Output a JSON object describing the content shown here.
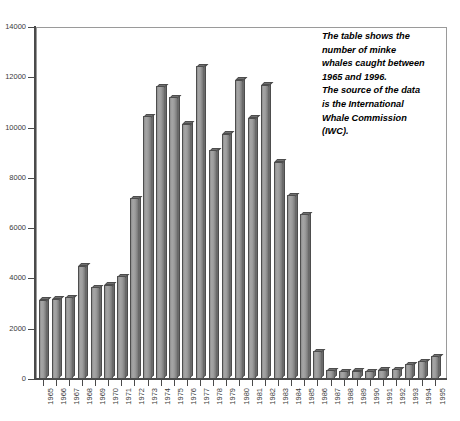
{
  "chart_data": {
    "type": "bar",
    "title": "",
    "xlabel": "",
    "ylabel": "",
    "ylim": [
      0,
      14000
    ],
    "ytick_labels": [
      "0",
      "2000",
      "4000",
      "6000",
      "8000",
      "10000",
      "12000",
      "14000"
    ],
    "ytick_values": [
      0,
      2000,
      4000,
      6000,
      8000,
      10000,
      12000,
      14000
    ],
    "grid": false,
    "legend": "none",
    "categories": [
      "1965",
      "1966",
      "1967",
      "1968",
      "1969",
      "1970",
      "1971",
      "1972",
      "1973",
      "1974",
      "1975",
      "1976",
      "1977",
      "1978",
      "1979",
      "1980",
      "1981",
      "1982",
      "1983",
      "1984",
      "1985",
      "1986",
      "1987",
      "1988",
      "1989",
      "1990",
      "1991",
      "1992",
      "1993",
      "1994",
      "1995"
    ],
    "values": [
      3150,
      3200,
      3250,
      4500,
      3650,
      3750,
      4100,
      7200,
      10450,
      11650,
      11200,
      10150,
      12450,
      9100,
      9750,
      11900,
      10400,
      11700,
      8650,
      7300,
      6550,
      1100,
      350,
      300,
      330,
      310,
      370,
      400,
      600,
      700,
      900
    ],
    "annotation": {
      "lines": [
        "The table shows the",
        "number of minke",
        "whales caught between",
        "1965 and 1996.",
        "The source of the data",
        "is the International",
        "Whale Commission",
        "(IWC)."
      ]
    },
    "colors": {
      "bar_face": "#9b9b9b",
      "bar_top": "#6f6f6f",
      "bar_side": "#6a6a6a",
      "bar_outline": "#4d4d4d",
      "axis": "#4a4a4a",
      "frame": "#9a9a9a",
      "background": "#ffffff",
      "text": "#000000"
    }
  }
}
